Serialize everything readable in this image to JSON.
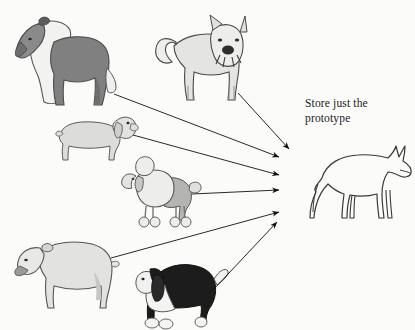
{
  "figure": {
    "background_color": "#fbfbf9",
    "caption": "Store just the\nprototype",
    "caption_line1": "Store just the",
    "caption_line2": "prototype"
  },
  "palette": {
    "ink": "#1a1a1a",
    "outline": "#4a4a4a",
    "dark_gray": "#7d7d7d",
    "mid_gray": "#b8b8b8",
    "light_gray": "#d8d8d8",
    "pale_gray": "#e8e8e8",
    "near_white": "#f2f2f0",
    "black": "#151515",
    "arrow": "#111111"
  },
  "exemplars": [
    {
      "id": "collie",
      "name": "collie",
      "breed_label": "Collie",
      "shading": "dark-gray body with white ruff and chest",
      "facing": "left",
      "x": 8,
      "y": 8,
      "width": 108,
      "height": 98
    },
    {
      "id": "akita",
      "name": "akita",
      "breed_label": "Akita",
      "shading": "pale gray, curled tail, front-facing head",
      "facing": "front-right",
      "x": 152,
      "y": 10,
      "width": 98,
      "height": 95
    },
    {
      "id": "dachshund",
      "name": "dachshund",
      "breed_label": "Dachshund",
      "shading": "light gray, long low body",
      "facing": "right",
      "x": 55,
      "y": 108,
      "width": 80,
      "height": 55
    },
    {
      "id": "poodle",
      "name": "poodle",
      "breed_label": "Poodle",
      "shading": "light gray with clipped pom-poms",
      "facing": "left",
      "x": 120,
      "y": 150,
      "width": 82,
      "height": 80
    },
    {
      "id": "bulldog",
      "name": "bulldog",
      "breed_label": "Bulldog",
      "shading": "pale gray, heavy build, tongue out",
      "facing": "left",
      "x": 12,
      "y": 228,
      "width": 105,
      "height": 82
    },
    {
      "id": "basset",
      "name": "basset-hound",
      "breed_label": "Basset Hound",
      "shading": "black body, white chest and legs",
      "facing": "left",
      "x": 133,
      "y": 255,
      "width": 95,
      "height": 72
    }
  ],
  "prototype": {
    "id": "prototype",
    "name": "prototype-dog",
    "label": "prototype dog outline",
    "shading": "plain line outline, no fill",
    "facing": "right",
    "x": 300,
    "y": 140,
    "width": 112,
    "height": 92
  },
  "arrows": [
    {
      "id": "arrow-akita",
      "from": "akita",
      "to": "prototype",
      "x1": 238,
      "y1": 93,
      "x2": 289,
      "y2": 149
    },
    {
      "id": "arrow-collie",
      "from": "collie",
      "to": "prototype",
      "x1": 114,
      "y1": 94,
      "x2": 279,
      "y2": 157
    },
    {
      "id": "arrow-dachshund",
      "from": "dachshund",
      "to": "prototype",
      "x1": 133,
      "y1": 135,
      "x2": 279,
      "y2": 175
    },
    {
      "id": "arrow-poodle",
      "from": "poodle",
      "to": "prototype",
      "x1": 192,
      "y1": 194,
      "x2": 279,
      "y2": 190
    },
    {
      "id": "arrow-bulldog",
      "from": "bulldog",
      "to": "prototype",
      "x1": 111,
      "y1": 258,
      "x2": 279,
      "y2": 212
    },
    {
      "id": "arrow-basset",
      "from": "basset",
      "to": "prototype",
      "x1": 213,
      "y1": 290,
      "x2": 277,
      "y2": 222
    }
  ]
}
